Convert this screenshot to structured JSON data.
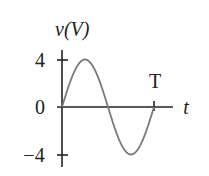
{
  "chart_data": {
    "type": "line",
    "title": "",
    "ylabel": "v(V)",
    "xlabel": "t",
    "yticks": [
      4,
      0,
      -4
    ],
    "ytick_labels": [
      "4",
      "0",
      "−4"
    ],
    "xtick_labels": [
      "T"
    ],
    "ylim": [
      -4,
      4
    ],
    "xlim": [
      0,
      1
    ],
    "grid": false,
    "series": [
      {
        "name": "v(t) = 4 sin(2πt/T)",
        "function": "sine",
        "amplitude": 4,
        "period": 1,
        "x": [
          0,
          0.125,
          0.25,
          0.375,
          0.5,
          0.625,
          0.75,
          0.875,
          1.0
        ],
        "y": [
          0,
          2.83,
          4,
          2.83,
          0,
          -2.83,
          -4,
          -2.83,
          0
        ]
      }
    ],
    "colors": {
      "axis": "#222222",
      "curve": "#7a7a7a"
    }
  }
}
